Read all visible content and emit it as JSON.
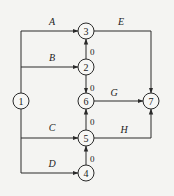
{
  "diagram": {
    "type": "activity-on-arrow network",
    "colors": {
      "line": "#2a2a2a",
      "background": "#f4f4f2",
      "node_fill": "#f7f7f5"
    },
    "nodes": [
      {
        "id": "1",
        "label": "1",
        "x": 21,
        "y": 101
      },
      {
        "id": "2",
        "label": "2",
        "x": 86,
        "y": 67
      },
      {
        "id": "3",
        "label": "3",
        "x": 86,
        "y": 31
      },
      {
        "id": "4",
        "label": "4",
        "x": 86,
        "y": 173
      },
      {
        "id": "5",
        "label": "5",
        "x": 86,
        "y": 138
      },
      {
        "id": "6",
        "label": "6",
        "x": 86,
        "y": 101
      },
      {
        "id": "7",
        "label": "7",
        "x": 151,
        "y": 101
      }
    ],
    "edges": [
      {
        "label": "A",
        "from": "1",
        "to": "3",
        "dummy": false
      },
      {
        "label": "B",
        "from": "1",
        "to": "2",
        "dummy": false
      },
      {
        "label": "C",
        "from": "1",
        "to": "5",
        "dummy": false
      },
      {
        "label": "D",
        "from": "1",
        "to": "4",
        "dummy": false
      },
      {
        "label": "E",
        "from": "3",
        "to": "7",
        "dummy": false
      },
      {
        "label": "G",
        "from": "6",
        "to": "7",
        "dummy": false
      },
      {
        "label": "H",
        "from": "5",
        "to": "7",
        "dummy": false
      },
      {
        "label": "0",
        "from": "2",
        "to": "3",
        "dummy": true
      },
      {
        "label": "0",
        "from": "2",
        "to": "6",
        "dummy": true
      },
      {
        "label": "0",
        "from": "5",
        "to": "6",
        "dummy": true
      },
      {
        "label": "0",
        "from": "4",
        "to": "5",
        "dummy": true
      }
    ]
  }
}
